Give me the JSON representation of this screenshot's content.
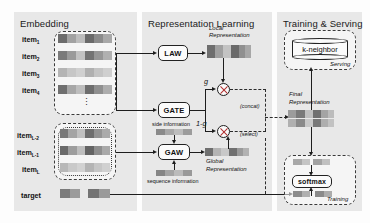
{
  "figure": {
    "type": "architecture-diagram",
    "panels": [
      {
        "id": "embedding",
        "title": "Embedding"
      },
      {
        "id": "representation",
        "title": "Representation Learning"
      },
      {
        "id": "training",
        "title": "Training & Serving"
      }
    ]
  },
  "embedding": {
    "title": "Embedding",
    "items_top": [
      {
        "label": "item",
        "sub": "1"
      },
      {
        "label": "item",
        "sub": "2"
      },
      {
        "label": "item",
        "sub": "3"
      },
      {
        "label": "item",
        "sub": "4"
      }
    ],
    "ellipsis": "⋮",
    "items_bottom": [
      {
        "label": "item",
        "sub": "L-2"
      },
      {
        "label": "item",
        "sub": "L-1"
      },
      {
        "label": "item",
        "sub": "L"
      }
    ],
    "target_label": "target"
  },
  "representation": {
    "title": "Representation Learning",
    "law_label": "LAW",
    "gate_label": "GATE",
    "gaw_label": "GAW",
    "local_rep_line1": "Local",
    "local_rep_line2": "Representation",
    "global_rep_line1": "Global",
    "global_rep_line2": "Representation",
    "side_information": "side information",
    "sequence_information": "sequence  information",
    "gate_weight": "g",
    "gate_weight_complement": "1-g",
    "concat_label": "(concat)",
    "select_label": "(select)"
  },
  "training": {
    "title": "Training & Serving",
    "knn_label": "k-neighbor",
    "serving_label": "Serving",
    "training_label": "Training",
    "softmax_label": "softmax",
    "final_rep_line1": "Final",
    "final_rep_line2": "Representation"
  },
  "colors": {
    "panel_bg": "#e8e8e8",
    "page_bg": "#fdfdfd",
    "stroke": "#1d1d1d",
    "dash_stroke": "#3a3a3a",
    "embed_dark": "#6e6e6e",
    "embed_mid": "#8f8f8f",
    "embed_light": "#b9b9b9",
    "multiply_x": "#b03030"
  }
}
